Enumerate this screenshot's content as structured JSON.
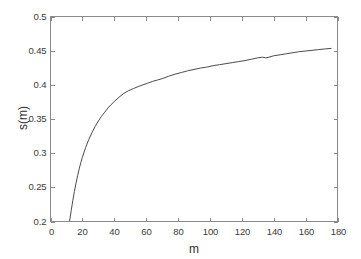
{
  "figure": {
    "background_color": "#ffffff",
    "axes_color": "#8a8a8a",
    "line_color": "#4a4a4a",
    "text_color": "#3a3a3a"
  },
  "chart_data": {
    "type": "line",
    "title": "",
    "subtitle": "",
    "xlabel": "m",
    "ylabel": "s(m)",
    "xlim": [
      0,
      180
    ],
    "ylim": [
      0.2,
      0.5
    ],
    "xticks": [
      0,
      20,
      40,
      60,
      80,
      100,
      120,
      140,
      160,
      180
    ],
    "xtick_labels": [
      "0",
      "20",
      "40",
      "60",
      "80",
      "100",
      "120",
      "140",
      "160",
      "180"
    ],
    "yticks": [
      0.2,
      0.25,
      0.3,
      0.35,
      0.4,
      0.45,
      0.5
    ],
    "ytick_labels": [
      "0.2",
      "0.25",
      "0.3",
      "0.35",
      "0.4",
      "0.45",
      "0.5"
    ],
    "grid": false,
    "legend": null,
    "annotations": [],
    "series": [
      {
        "name": "s(m)",
        "color": "#4a4a4a",
        "line_width": 1,
        "x": [
          12,
          13,
          14,
          15,
          16,
          17,
          18,
          19,
          20,
          22,
          24,
          26,
          28,
          30,
          32,
          34,
          36,
          38,
          40,
          43,
          46,
          49,
          52,
          55,
          58,
          61,
          64,
          67,
          70,
          74,
          78,
          82,
          86,
          90,
          94,
          98,
          102,
          106,
          110,
          114,
          118,
          122,
          126,
          130,
          133,
          135,
          137,
          140,
          144,
          148,
          152,
          156,
          160,
          164,
          168,
          172,
          176
        ],
        "y": [
          0.201,
          0.216,
          0.231,
          0.244,
          0.256,
          0.267,
          0.277,
          0.286,
          0.294,
          0.308,
          0.32,
          0.33,
          0.339,
          0.347,
          0.354,
          0.36,
          0.366,
          0.371,
          0.3755,
          0.382,
          0.3875,
          0.3915,
          0.3945,
          0.3975,
          0.4,
          0.4025,
          0.405,
          0.407,
          0.409,
          0.4125,
          0.4155,
          0.418,
          0.4205,
          0.4225,
          0.4245,
          0.426,
          0.428,
          0.4295,
          0.431,
          0.4325,
          0.434,
          0.4355,
          0.4375,
          0.4395,
          0.4405,
          0.4395,
          0.4405,
          0.4425,
          0.444,
          0.4455,
          0.447,
          0.4485,
          0.4495,
          0.4505,
          0.4515,
          0.4525,
          0.4533
        ]
      }
    ]
  }
}
